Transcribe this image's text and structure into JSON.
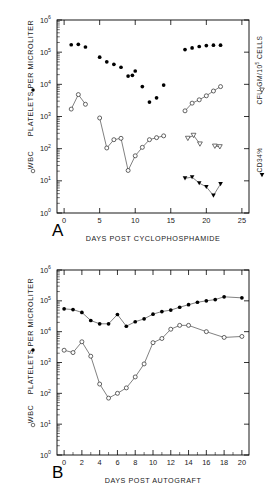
{
  "figure": {
    "background": "#ffffff",
    "ink": "#000000",
    "line_color": "#3c3c3c"
  },
  "panels": [
    {
      "tag": "A",
      "xlabel": "DAYS POST CYCLOPHOSPHAMIDE",
      "left_axis_label": "PLATELETS PER MICROLITER",
      "left_axis_marker_label": "WBC",
      "right_axis_label": "CFU-GM/10",
      "right_axis_label_exp": "5",
      "right_axis_label_tail": " CELLS",
      "right_axis_marker_label": "CD34%",
      "chart_data": {
        "type": "scatter",
        "title": "A",
        "xlabel": "DAYS POST CYCLOPHOSPHAMIDE",
        "ylabel": "PLATELETS PER MICROLITER / WBC",
        "y2label": "CFU-GM/10^5 CELLS / CD34%",
        "yscale": "log",
        "ylim": [
          1,
          1000000
        ],
        "xlim": [
          -1,
          26
        ],
        "xticks": [
          0,
          5,
          10,
          15,
          20,
          25
        ],
        "yticks": [
          1,
          10,
          100,
          1000,
          10000,
          100000,
          1000000
        ],
        "yticklabels": [
          "10^0",
          "10^1",
          "10^2",
          "10^3",
          "10^4",
          "10^5",
          "10^6"
        ],
        "grid": false,
        "legend": "axis-labels",
        "series": [
          {
            "name": "PLATELETS PER MICROLITER",
            "marker": "filled-circle",
            "connected": false,
            "axis": "left",
            "x": [
              1,
              2,
              3,
              5,
              6,
              7,
              8,
              9,
              9.6,
              10,
              11,
              12,
              13,
              14,
              17,
              18,
              19,
              20,
              21,
              22
            ],
            "y": [
              170000,
              175000,
              145000,
              70000,
              50000,
              42000,
              34000,
              18000,
              19000,
              26000,
              8500,
              2800,
              3800,
              9500,
              120000,
              135000,
              150000,
              160000,
              165000,
              165000
            ]
          },
          {
            "name": "WBC",
            "marker": "open-circle",
            "connected": true,
            "axis": "left",
            "segments": [
              {
                "x": [
                  1,
                  2,
                  3
                ],
                "y": [
                  1700,
                  4800,
                  2400
                ]
              },
              {
                "x": [
                  5,
                  6,
                  7,
                  8,
                  9,
                  10,
                  11,
                  12,
                  13,
                  14
                ],
                "y": [
                  900,
                  105,
                  190,
                  210,
                  21,
                  60,
                  110,
                  190,
                  220,
                  250
                ]
              },
              {
                "x": [
                  17,
                  18,
                  19,
                  20,
                  21,
                  22
                ],
                "y": [
                  1500,
                  2600,
                  3300,
                  4400,
                  6200,
                  8500
                ]
              }
            ]
          },
          {
            "name": "CFU-GM/10^5 CELLS",
            "marker": "open-triangle-down",
            "connected": true,
            "axis": "right",
            "segments": [
              {
                "x": [
                  17.4,
                  18.2,
                  19.1
                ],
                "y": [
                  210,
                  260,
                  140
                ]
              },
              {
                "x": [
                  21.2,
                  21.9
                ],
                "y": [
                  120,
                  115
                ]
              }
            ]
          },
          {
            "name": "CD34%",
            "marker": "filled-triangle-down",
            "connected": true,
            "axis": "right",
            "segments": [
              {
                "x": [
                  17,
                  18,
                  19,
                  20,
                  21,
                  22
                ],
                "y": [
                  12,
                  13,
                  8.5,
                  6.5,
                  3.5,
                  8
                ]
              }
            ]
          }
        ]
      }
    },
    {
      "tag": "B",
      "xlabel": "DAYS POST AUTOGRAFT",
      "left_axis_label": "PLATELETS PER MICROLITER",
      "left_axis_marker_label": "WBC",
      "chart_data": {
        "type": "line",
        "title": "B",
        "xlabel": "DAYS POST AUTOGRAFT",
        "ylabel": "PLATELETS PER MICROLITER / WBC",
        "yscale": "log",
        "ylim": [
          1,
          1000000
        ],
        "xlim": [
          -0.8,
          20.8
        ],
        "xticks": [
          0,
          2,
          4,
          6,
          8,
          10,
          12,
          14,
          16,
          18,
          20
        ],
        "yticks": [
          1,
          10,
          100,
          1000,
          10000,
          100000,
          1000000
        ],
        "yticklabels": [
          "10^0",
          "10^1",
          "10^2",
          "10^3",
          "10^4",
          "10^5",
          "10^6"
        ],
        "grid": false,
        "series": [
          {
            "name": "PLATELETS PER MICROLITER",
            "marker": "filled-circle",
            "connected": true,
            "x": [
              0,
              1,
              2,
              3,
              4,
              5,
              6,
              7,
              8,
              9,
              10,
              11,
              12,
              13,
              14,
              15,
              16,
              17,
              18,
              20
            ],
            "y": [
              55000,
              52000,
              42000,
              23000,
              18000,
              18000,
              36000,
              15000,
              21000,
              26000,
              37000,
              45000,
              50000,
              62000,
              75000,
              90000,
              100000,
              110000,
              135000,
              125000
            ]
          },
          {
            "name": "WBC",
            "marker": "open-circle",
            "connected": true,
            "x": [
              0,
              1,
              2,
              3,
              4,
              5,
              6,
              7,
              8,
              9,
              10,
              11,
              12,
              13,
              14,
              16,
              18,
              20
            ],
            "y": [
              2500,
              2100,
              4700,
              1600,
              200,
              70,
              100,
              150,
              340,
              900,
              4400,
              6000,
              12000,
              16000,
              16000,
              10000,
              6500,
              7000
            ]
          }
        ]
      }
    }
  ]
}
